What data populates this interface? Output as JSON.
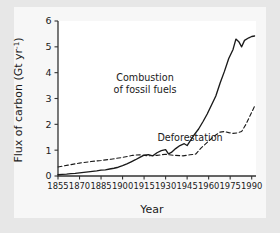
{
  "figure": {
    "background_color": "#e7e7e7",
    "panel_color": "#f7f7f7",
    "plot_background": "#ffffff",
    "axis_color": "#333333",
    "text_color": "#1a1a1a"
  },
  "chart_data": {
    "type": "line",
    "title": "",
    "xlabel": "Year",
    "ylabel": "Flux of carbon (Gt yr⁻¹)",
    "ylabel_parts": {
      "main": "Flux of carbon (Gt yr",
      "superscript": "-1",
      "close": ")"
    },
    "xlim": [
      1855,
      1993
    ],
    "ylim": [
      0,
      6
    ],
    "xticks": [
      1855,
      1870,
      1885,
      1900,
      1915,
      1930,
      1945,
      1960,
      1975,
      1990
    ],
    "xtick_labels": [
      "1855",
      "1870",
      "1885",
      "1900",
      "1915",
      "1930",
      "1945",
      "1960",
      "1975",
      "1990"
    ],
    "yticks": [
      0,
      1,
      2,
      3,
      4,
      5,
      6
    ],
    "ytick_labels": [
      "0",
      "1",
      "2",
      "3",
      "4",
      "5",
      "6"
    ],
    "grid": false,
    "legend_position": "inline-annotation",
    "series": [
      {
        "name": "Combustion of fossil fuels",
        "label": "Combustion",
        "label_line2": "of fossil fuels",
        "style": "solid",
        "color": "#1a1a1a",
        "x": [
          1855,
          1858,
          1861,
          1864,
          1867,
          1870,
          1873,
          1876,
          1879,
          1882,
          1885,
          1888,
          1891,
          1894,
          1897,
          1900,
          1903,
          1906,
          1909,
          1912,
          1915,
          1918,
          1921,
          1924,
          1927,
          1930,
          1932,
          1934,
          1937,
          1940,
          1943,
          1945,
          1947,
          1950,
          1953,
          1956,
          1959,
          1962,
          1965,
          1968,
          1971,
          1974,
          1977,
          1979,
          1981,
          1983,
          1985,
          1988,
          1990,
          1992
        ],
        "y": [
          0.05,
          0.06,
          0.07,
          0.09,
          0.1,
          0.12,
          0.14,
          0.16,
          0.18,
          0.2,
          0.23,
          0.24,
          0.27,
          0.3,
          0.34,
          0.4,
          0.47,
          0.55,
          0.63,
          0.72,
          0.81,
          0.83,
          0.78,
          0.9,
          0.98,
          1.02,
          0.86,
          0.91,
          1.06,
          1.18,
          1.25,
          1.18,
          1.35,
          1.6,
          1.82,
          2.1,
          2.4,
          2.75,
          3.1,
          3.6,
          4.05,
          4.55,
          4.9,
          5.3,
          5.2,
          5.0,
          5.25,
          5.35,
          5.4,
          5.42
        ]
      },
      {
        "name": "Deforestation",
        "label": "Deforestation",
        "style": "dashed",
        "color": "#1a1a1a",
        "x": [
          1855,
          1862,
          1870,
          1878,
          1885,
          1892,
          1900,
          1907,
          1912,
          1918,
          1924,
          1930,
          1936,
          1942,
          1947,
          1951,
          1955,
          1960,
          1964,
          1968,
          1971,
          1974,
          1977,
          1980,
          1983,
          1986,
          1989,
          1992
        ],
        "y": [
          0.35,
          0.42,
          0.5,
          0.56,
          0.6,
          0.65,
          0.72,
          0.8,
          0.82,
          0.78,
          0.8,
          0.84,
          0.8,
          0.78,
          0.82,
          0.85,
          1.1,
          1.35,
          1.55,
          1.7,
          1.72,
          1.68,
          1.65,
          1.67,
          1.72,
          2.0,
          2.35,
          2.7
        ]
      }
    ]
  }
}
